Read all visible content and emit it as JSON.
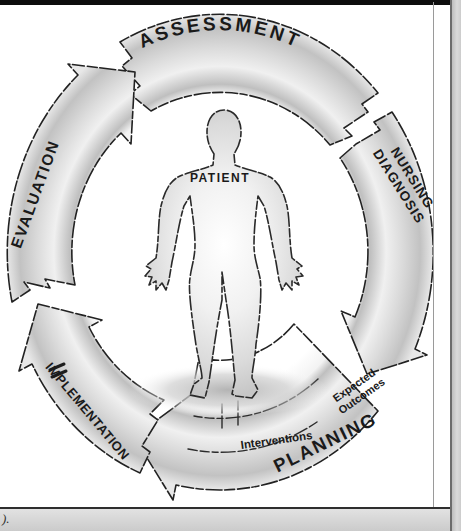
{
  "diagram": {
    "type": "cycle",
    "direction": "clockwise",
    "center": "PATIENT",
    "steps": [
      "ASSESSMENT",
      "NURSING DIAGNOSIS",
      "PLANNING",
      "IMPLEMENTATION",
      "EVALUATION"
    ],
    "planning_components": [
      "Expected Outcomes",
      "Interventions"
    ]
  },
  "labels": {
    "assessment": "ASSESSMENT",
    "nursing_line1": "NURSING",
    "nursing_line2": "DIAGNOSIS",
    "planning": "PLANNING",
    "expected_line1": "Expected",
    "expected_line2": "Outcomes",
    "interventions": "Interventions",
    "implementation": "IMPLEMENTATION",
    "evaluation": "EVALUATION",
    "patient": "PATIENT"
  },
  "page": {
    "caption_fragment": ")."
  },
  "colors": {
    "ink": "#1a1a1a",
    "band_gray": "#c6c6c6",
    "page_margin_gray": "#cbcbcb"
  }
}
